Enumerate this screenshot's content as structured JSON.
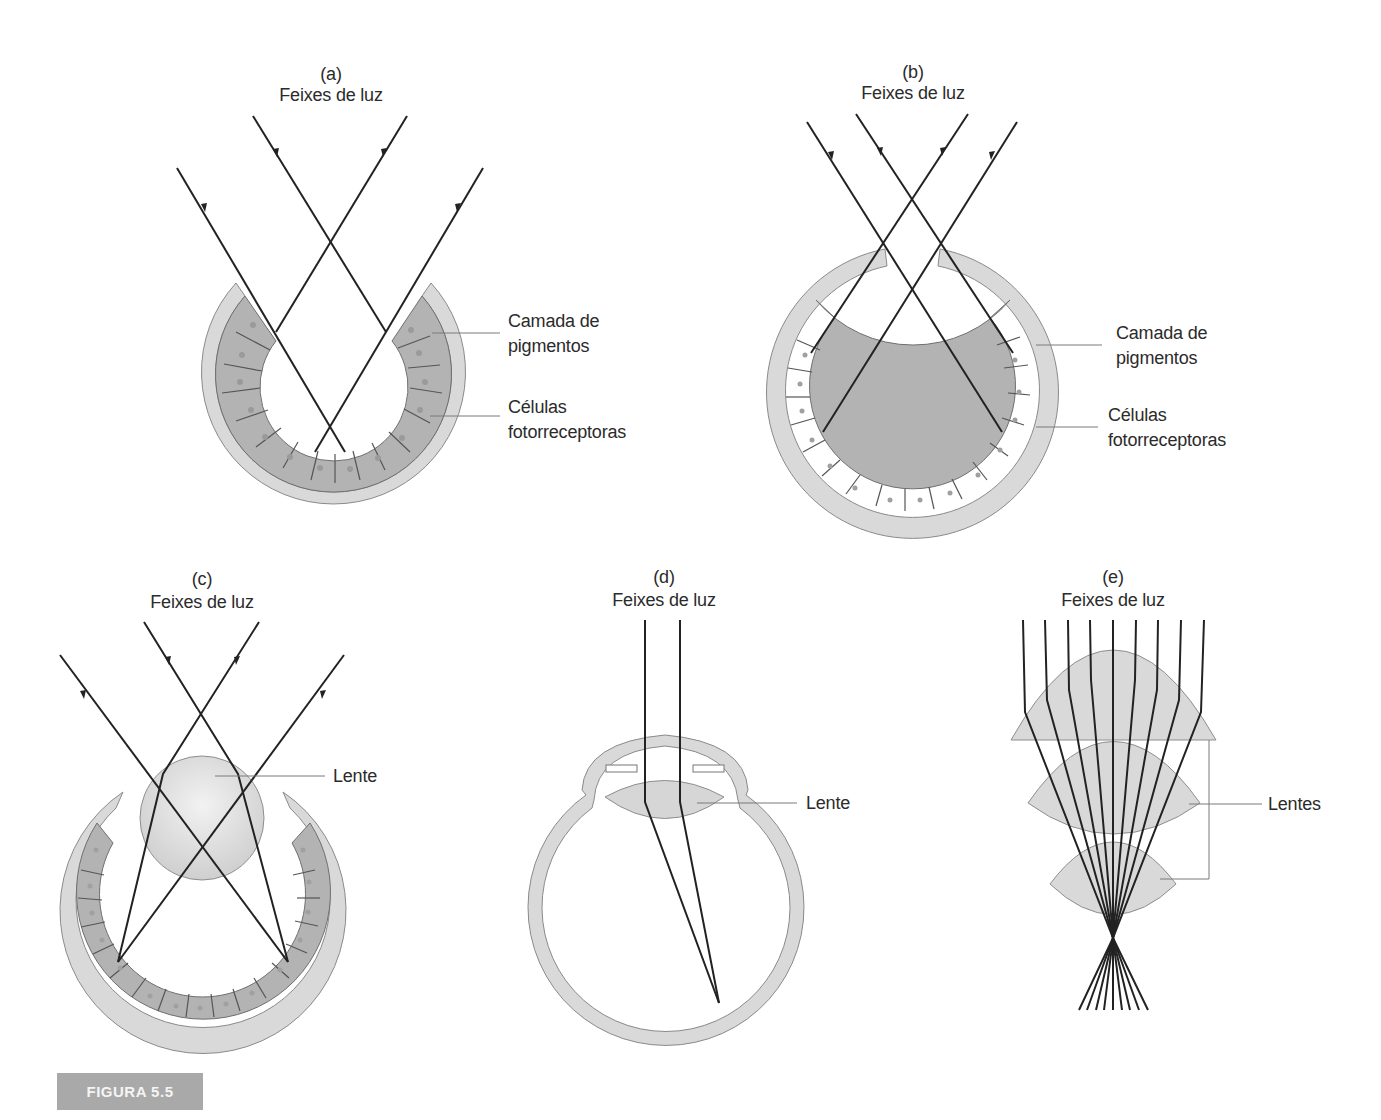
{
  "figure": {
    "label": "FIGURA 5.5",
    "colors": {
      "outer_layer": "#d9d9d9",
      "cell_layer": "#b3b3b3",
      "lens": "#dcdcdc",
      "ray": "#222222",
      "leader": "#777777",
      "badge_bg": "#a9a9a9"
    }
  },
  "panels": {
    "a": {
      "id": "(a)",
      "title": "Feixes de luz",
      "labels": [
        "Camada de",
        "pigmentos",
        "Células",
        "fotorreceptoras"
      ]
    },
    "b": {
      "id": "(b)",
      "title": "Feixes de luz",
      "labels": [
        "Camada de",
        "pigmentos",
        "Células",
        "fotorreceptoras"
      ]
    },
    "c": {
      "id": "(c)",
      "title": "Feixes de luz",
      "lens_label": "Lente"
    },
    "d": {
      "id": "(d)",
      "title": "Feixes de luz",
      "lens_label": "Lente"
    },
    "e": {
      "id": "(e)",
      "title": "Feixes de luz",
      "lens_label": "Lentes"
    }
  }
}
